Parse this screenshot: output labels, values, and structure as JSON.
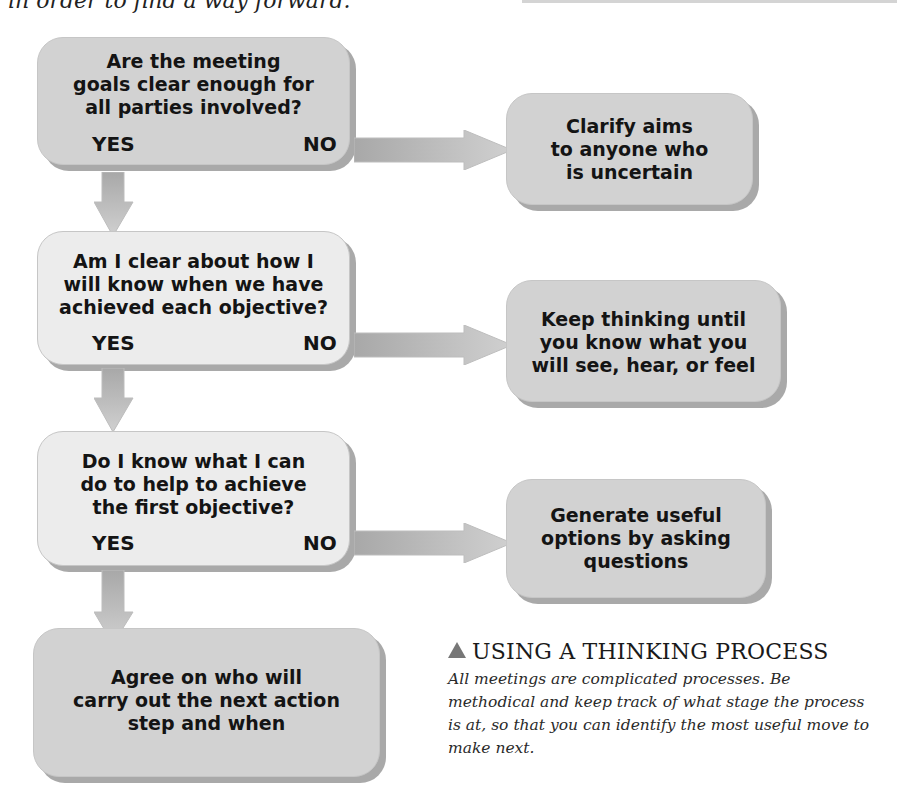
{
  "intro_text": "in order to find a way forward.",
  "flowchart": {
    "questions": [
      {
        "lines": [
          "Are the meeting",
          "goals clear enough for",
          "all parties involved?"
        ],
        "yes_label": "YES",
        "no_label": "NO",
        "no_result_lines": [
          "Clarify aims",
          "to anyone who",
          "is uncertain"
        ]
      },
      {
        "lines": [
          "Am I clear about how I",
          "will know when we have",
          "achieved each objective?"
        ],
        "yes_label": "YES",
        "no_label": "NO",
        "no_result_lines": [
          "Keep thinking until",
          "you know what you",
          "will see, hear, or feel"
        ]
      },
      {
        "lines": [
          "Do I know what I can",
          "do to help to achieve",
          "the first objective?"
        ],
        "yes_label": "YES",
        "no_label": "NO",
        "no_result_lines": [
          "Generate useful",
          "options by asking",
          "questions"
        ]
      }
    ],
    "final_step": {
      "lines": [
        "Agree on who will",
        "carry out the next action",
        "step and when"
      ]
    }
  },
  "caption": {
    "title": "USING A THINKING PROCESS",
    "icon": "triangle-up-icon",
    "body": "All meetings are complicated processes. Be methodical and keep track of what stage the process is at, so that you can identify the most useful move to make next."
  },
  "colors": {
    "box_dark": "#d2d2d2",
    "box_light": "#ececec",
    "shadow": "#a9a9a9",
    "arrow": "#b8b8b8"
  }
}
